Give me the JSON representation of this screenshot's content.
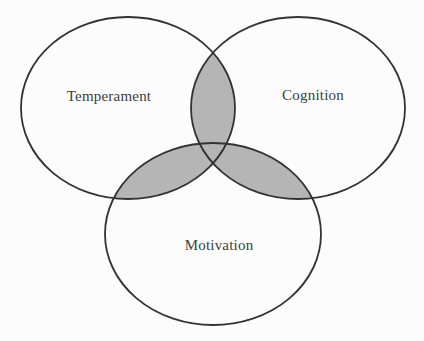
{
  "figure": {
    "type": "venn-diagram-3-circles",
    "circles": {
      "temperament": {
        "label": "Temperament"
      },
      "cognition": {
        "label": "Cognition"
      },
      "motivation": {
        "label": "Motivation"
      }
    },
    "colors": {
      "background": "#fcfcfc",
      "overlap_fill": "#b5b5b5",
      "circle_stroke": "#333333",
      "label_text": "#3d3d3d"
    }
  }
}
